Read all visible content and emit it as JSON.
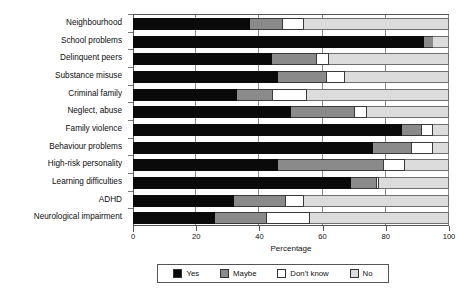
{
  "chart_data": {
    "type": "bar",
    "orientation": "horizontal",
    "stacked": true,
    "stack_mode": "percent",
    "title": "",
    "subtitle": "",
    "xlabel": "Percentage",
    "ylabel": "",
    "xlim": [
      0,
      100
    ],
    "xticks": [
      0,
      20,
      40,
      60,
      80,
      100
    ],
    "xtick_labels": [
      "0",
      "20",
      "40",
      "60",
      "80",
      "100"
    ],
    "grid": "vertical",
    "legend_position": "bottom",
    "categories": [
      "Neighbourhood",
      "School problems",
      "Delinquent peers",
      "Substance misuse",
      "Criminal family",
      "Neglect, abuse",
      "Family violence",
      "Behaviour problems",
      "High-risk personality",
      "Learning difficulties",
      "ADHD",
      "Neurological impairment"
    ],
    "series": [
      {
        "name": "Yes",
        "color": "#0a0a0a",
        "values": [
          37,
          92,
          44,
          46,
          33,
          50,
          85,
          76,
          46,
          69,
          32,
          26
        ]
      },
      {
        "name": "Maybe",
        "color": "#8a8a8a",
        "values": [
          10,
          3,
          14,
          15,
          11,
          20,
          6,
          12,
          33,
          8,
          16,
          16
        ]
      },
      {
        "name": "Don't know",
        "color": "#ffffff",
        "values": [
          7,
          0,
          4,
          6,
          11,
          4,
          4,
          7,
          7,
          1,
          6,
          14
        ]
      },
      {
        "name": "No",
        "color": "#dcdcdc",
        "values": [
          46,
          5,
          38,
          33,
          45,
          26,
          5,
          5,
          14,
          22,
          46,
          44
        ]
      }
    ]
  },
  "legend": {
    "items": [
      {
        "label": "Yes",
        "color": "#0a0a0a"
      },
      {
        "label": "Maybe",
        "color": "#8a8a8a"
      },
      {
        "label": "Don't know",
        "color": "#ffffff"
      },
      {
        "label": "No",
        "color": "#dcdcdc"
      }
    ]
  },
  "axis": {
    "x_title": "Percentage"
  }
}
